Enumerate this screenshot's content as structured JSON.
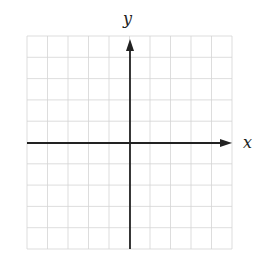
{
  "diagram": {
    "type": "coordinate-plane",
    "x_axis_label": "x",
    "y_axis_label": "y",
    "grid": {
      "columns": 10,
      "rows": 10,
      "left": 27,
      "top": 36,
      "right": 232,
      "bottom": 249,
      "line_color": "#d4d4d4"
    },
    "origin": {
      "x": 130,
      "y": 143
    },
    "axis_color": "#222222"
  }
}
